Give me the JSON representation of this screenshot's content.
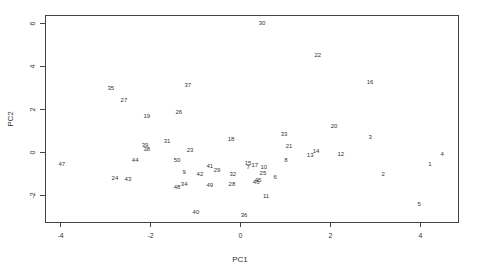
{
  "chart_data": {
    "type": "scatter",
    "title": "",
    "xlabel": "PC1",
    "ylabel": "PC2",
    "xlim": [
      -4.3,
      4.85
    ],
    "ylim": [
      -3.25,
      6.35
    ],
    "xticks": [
      -4,
      -2,
      0,
      2,
      4
    ],
    "yticks": [
      -2,
      0,
      2,
      4,
      6
    ],
    "xtick_labels": [
      "-4",
      "-2",
      "0",
      "2",
      "4"
    ],
    "ytick_labels": [
      "-2",
      "0",
      "2",
      "4",
      "6"
    ],
    "grid": false,
    "legend": null,
    "marker": "text-label",
    "points": [
      {
        "label": "30",
        "x": 0.49,
        "y": 6.0
      },
      {
        "label": "22",
        "x": 1.73,
        "y": 4.51
      },
      {
        "label": "16",
        "x": 2.89,
        "y": 3.26
      },
      {
        "label": "35",
        "x": -2.87,
        "y": 2.98
      },
      {
        "label": "37",
        "x": -1.16,
        "y": 3.12
      },
      {
        "label": "27",
        "x": -2.58,
        "y": 2.42
      },
      {
        "label": "26",
        "x": -1.36,
        "y": 1.86
      },
      {
        "label": "19",
        "x": -2.07,
        "y": 1.67
      },
      {
        "label": "20",
        "x": 2.09,
        "y": 1.21
      },
      {
        "label": "33",
        "x": 0.98,
        "y": 0.84
      },
      {
        "label": "3",
        "x": 2.89,
        "y": 0.7
      },
      {
        "label": "18",
        "x": -0.2,
        "y": 0.6
      },
      {
        "label": "31",
        "x": -1.62,
        "y": 0.51
      },
      {
        "label": "39",
        "x": -2.11,
        "y": 0.33
      },
      {
        "label": "38",
        "x": -2.07,
        "y": 0.14
      },
      {
        "label": "21",
        "x": 1.09,
        "y": 0.28
      },
      {
        "label": "23",
        "x": -1.11,
        "y": 0.09
      },
      {
        "label": "14",
        "x": 1.69,
        "y": 0.05
      },
      {
        "label": "13",
        "x": 1.56,
        "y": -0.14
      },
      {
        "label": "12",
        "x": 2.24,
        "y": -0.09
      },
      {
        "label": "4",
        "x": 4.49,
        "y": -0.09
      },
      {
        "label": "50",
        "x": -1.4,
        "y": -0.37
      },
      {
        "label": "44",
        "x": -2.33,
        "y": -0.37
      },
      {
        "label": "8",
        "x": 1.02,
        "y": -0.37
      },
      {
        "label": "47",
        "x": -3.96,
        "y": -0.56
      },
      {
        "label": "1",
        "x": 4.22,
        "y": -0.56
      },
      {
        "label": "15",
        "x": 0.18,
        "y": -0.51
      },
      {
        "label": "7",
        "x": 0.18,
        "y": -0.7
      },
      {
        "label": "17",
        "x": 0.33,
        "y": -0.6
      },
      {
        "label": "10",
        "x": 0.53,
        "y": -0.7
      },
      {
        "label": "41",
        "x": -0.67,
        "y": -0.65
      },
      {
        "label": "29",
        "x": -0.51,
        "y": -0.84
      },
      {
        "label": "9",
        "x": -1.24,
        "y": -0.93
      },
      {
        "label": "42",
        "x": -0.89,
        "y": -1.02
      },
      {
        "label": "32",
        "x": -0.16,
        "y": -1.02
      },
      {
        "label": "25",
        "x": 0.51,
        "y": -0.98
      },
      {
        "label": "2",
        "x": 3.18,
        "y": -1.02
      },
      {
        "label": "6",
        "x": 0.78,
        "y": -1.16
      },
      {
        "label": "24",
        "x": -2.78,
        "y": -1.21
      },
      {
        "label": "43",
        "x": -2.49,
        "y": -1.26
      },
      {
        "label": "45",
        "x": 0.4,
        "y": -1.3
      },
      {
        "label": "46",
        "x": 0.36,
        "y": -1.4
      },
      {
        "label": "34",
        "x": -1.24,
        "y": -1.49
      },
      {
        "label": "48",
        "x": -1.4,
        "y": -1.63
      },
      {
        "label": "49",
        "x": -0.67,
        "y": -1.53
      },
      {
        "label": "28",
        "x": -0.18,
        "y": -1.49
      },
      {
        "label": "11",
        "x": 0.58,
        "y": -2.05
      },
      {
        "label": "5",
        "x": 3.98,
        "y": -2.42
      },
      {
        "label": "40",
        "x": -0.98,
        "y": -2.79
      },
      {
        "label": "36",
        "x": 0.09,
        "y": -2.93
      }
    ]
  },
  "colors": {
    "axis": "#333333",
    "text": "#333333",
    "background": "#ffffff"
  }
}
